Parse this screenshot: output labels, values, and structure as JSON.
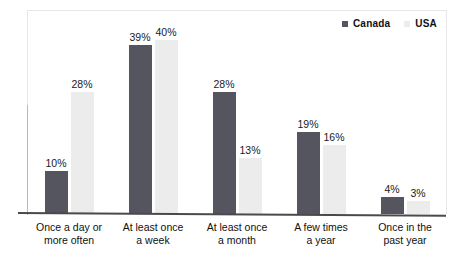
{
  "chart_data": {
    "type": "bar",
    "title": "",
    "subtitle": "",
    "xlabel": "",
    "ylabel": "",
    "ylim": [
      0,
      47
    ],
    "grid": false,
    "legend_position": "top-right",
    "orientation": "vertical",
    "grouping": "grouped",
    "value_suffix": "%",
    "categories": [
      {
        "line1": "Once a day or",
        "line2": "more often"
      },
      {
        "line1": "At least once",
        "line2": "a week"
      },
      {
        "line1": "At least once",
        "line2": "a month"
      },
      {
        "line1": "A few times",
        "line2": "a year"
      },
      {
        "line1": "Once in the",
        "line2": "past year"
      }
    ],
    "series": [
      {
        "name": "Canada",
        "color": "#55555f",
        "values": [
          10,
          39,
          28,
          19,
          4
        ],
        "labels": [
          "10%",
          "39%",
          "28%",
          "19%",
          "4%"
        ]
      },
      {
        "name": "USA",
        "color": "#ececec",
        "values": [
          28,
          40,
          13,
          16,
          3
        ],
        "labels": [
          "28%",
          "40%",
          "13%",
          "16%",
          "3%"
        ]
      }
    ]
  },
  "legend": {
    "items": [
      {
        "label": "Canada",
        "swatch": "canada-swatch"
      },
      {
        "label": "USA",
        "swatch": "usa-swatch"
      }
    ]
  }
}
